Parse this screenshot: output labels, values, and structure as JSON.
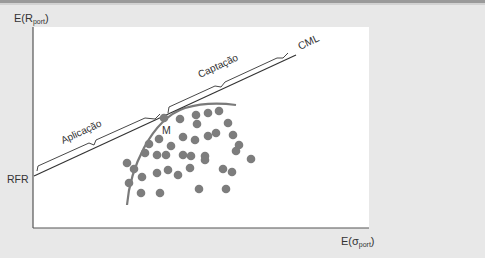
{
  "chart_data": {
    "type": "scatter",
    "title": "",
    "ylabel": "E(R_port)",
    "ylabel_main": "E(R",
    "ylabel_sub": "port",
    "ylabel_close": ")",
    "xlabel": "E(σ_port)",
    "xlabel_main": "E(σ",
    "xlabel_sub": "port",
    "xlabel_close": ")",
    "grid": false,
    "legend": "none",
    "lines": [
      {
        "name": "CML",
        "label": "CML",
        "from": "RFR",
        "through": "M"
      }
    ],
    "annotations": {
      "rfr": "RFR",
      "market_portfolio": "M",
      "lending_segment": "Aplicação",
      "borrowing_segment": "Captação",
      "cml": "CML"
    },
    "efficient_frontier": "curved arc tangent to CML at M",
    "points_pixel": [
      [
        164,
        118
      ],
      [
        180,
        119
      ],
      [
        196,
        115
      ],
      [
        208,
        113
      ],
      [
        219,
        111
      ],
      [
        197,
        124
      ],
      [
        228,
        123
      ],
      [
        208,
        136
      ],
      [
        216,
        133
      ],
      [
        233,
        135
      ],
      [
        239,
        145
      ],
      [
        149,
        144
      ],
      [
        159,
        139
      ],
      [
        171,
        146
      ],
      [
        183,
        137
      ],
      [
        195,
        140
      ],
      [
        145,
        153
      ],
      [
        157,
        155
      ],
      [
        166,
        155
      ],
      [
        183,
        155
      ],
      [
        191,
        156
      ],
      [
        205,
        156
      ],
      [
        236,
        151
      ],
      [
        127,
        163
      ],
      [
        134,
        169
      ],
      [
        142,
        177
      ],
      [
        157,
        173
      ],
      [
        168,
        170
      ],
      [
        178,
        175
      ],
      [
        190,
        168
      ],
      [
        205,
        160
      ],
      [
        223,
        169
      ],
      [
        232,
        172
      ],
      [
        251,
        159
      ],
      [
        129,
        183
      ],
      [
        141,
        193
      ],
      [
        160,
        193
      ],
      [
        199,
        189
      ],
      [
        226,
        189
      ]
    ],
    "colors": {
      "background": "#e8e8e8",
      "plot_area": "#ffffff",
      "axis": "#444444",
      "cml": "#333333",
      "frontier": "#7a7a7a",
      "dots": "#7d7d7d"
    }
  }
}
